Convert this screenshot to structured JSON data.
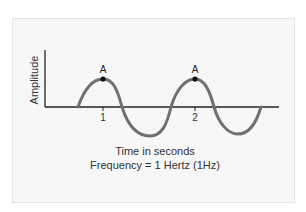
{
  "figure": {
    "y_axis_label": "Amplitude",
    "x_ticks": [
      {
        "label": "1",
        "x": 103
      },
      {
        "label": "2",
        "x": 195
      }
    ],
    "peaks": [
      {
        "label": "A",
        "x": 103,
        "y": 79
      },
      {
        "label": "A",
        "x": 195,
        "y": 79
      }
    ],
    "caption_line1": "Time in seconds",
    "caption_line2": "Frequency = 1 Hertz (1Hz)",
    "colors": {
      "wave": "#707070",
      "axis": "#222222",
      "panel": "#f7f7f7",
      "peak_dot": "#111111"
    }
  }
}
